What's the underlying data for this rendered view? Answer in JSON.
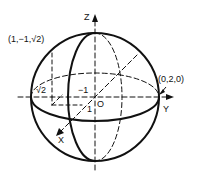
{
  "diagram": {
    "type": "sphere-3d-axes",
    "axes": {
      "x_label": "X",
      "y_label": "Y",
      "z_label": "Z",
      "origin_label": "O"
    },
    "points": {
      "top_left": "(1,−1,√2)",
      "right": "(0,2,0)"
    },
    "annotations": {
      "sqrt2": "√2",
      "minus_one": "−1",
      "one": "1"
    },
    "colors": {
      "stroke": "#111111",
      "background": "#ffffff"
    }
  }
}
